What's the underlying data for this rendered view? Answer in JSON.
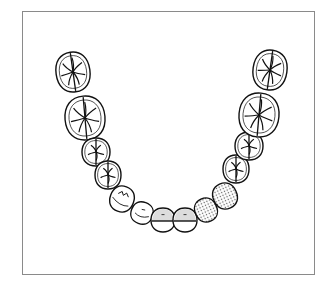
{
  "diagram": {
    "colors": {
      "frame": "#8a8a8a",
      "outline": "#111111",
      "shaded_fill": "#dcdcdc",
      "dotted_fill": "#555555",
      "background": "#ffffff"
    },
    "teeth": [
      {
        "id": "L-M1",
        "type": "molar",
        "side": "left",
        "cx": 73,
        "cy": 72,
        "rx": 17,
        "ry": 20,
        "rot": -8,
        "fill": "none"
      },
      {
        "id": "L-M2",
        "type": "molar",
        "side": "left",
        "cx": 85,
        "cy": 118,
        "rx": 20,
        "ry": 22,
        "rot": -5,
        "fill": "none"
      },
      {
        "id": "L-PM1",
        "type": "premolar",
        "side": "left",
        "cx": 96,
        "cy": 152,
        "rx": 14,
        "ry": 14,
        "rot": 0,
        "fill": "none"
      },
      {
        "id": "L-PM2",
        "type": "premolar",
        "side": "left",
        "cx": 108,
        "cy": 175,
        "rx": 13,
        "ry": 14,
        "rot": 0,
        "fill": "none"
      },
      {
        "id": "L-C",
        "type": "canine",
        "side": "left",
        "cx": 122,
        "cy": 199,
        "rx": 12,
        "ry": 13,
        "rot": 20,
        "fill": "none"
      },
      {
        "id": "L-I2",
        "type": "incisor",
        "side": "left",
        "cx": 142,
        "cy": 213,
        "rx": 11,
        "ry": 11,
        "rot": 20,
        "fill": "none"
      },
      {
        "id": "L-I1",
        "type": "incisor",
        "side": "left",
        "cx": 163,
        "cy": 220,
        "rx": 12,
        "ry": 12,
        "rot": 0,
        "fill": "half-shaded"
      },
      {
        "id": "R-I1",
        "type": "incisor",
        "side": "right",
        "cx": 185,
        "cy": 220,
        "rx": 12,
        "ry": 12,
        "rot": 0,
        "fill": "half-shaded"
      },
      {
        "id": "R-I2",
        "type": "incisor",
        "side": "right",
        "cx": 206,
        "cy": 210,
        "rx": 11,
        "ry": 12,
        "rot": -25,
        "fill": "dotted"
      },
      {
        "id": "R-C",
        "type": "canine",
        "side": "right",
        "cx": 225,
        "cy": 196,
        "rx": 12,
        "ry": 13,
        "rot": -25,
        "fill": "dotted"
      },
      {
        "id": "R-PM2",
        "type": "premolar",
        "side": "right",
        "cx": 236,
        "cy": 169,
        "rx": 13,
        "ry": 14,
        "rot": 0,
        "fill": "none"
      },
      {
        "id": "R-PM1",
        "type": "premolar",
        "side": "right",
        "cx": 249,
        "cy": 146,
        "rx": 14,
        "ry": 14,
        "rot": 0,
        "fill": "none"
      },
      {
        "id": "R-M2",
        "type": "molar",
        "side": "right",
        "cx": 259,
        "cy": 115,
        "rx": 20,
        "ry": 22,
        "rot": 5,
        "fill": "none"
      },
      {
        "id": "R-M1",
        "type": "molar",
        "side": "right",
        "cx": 270,
        "cy": 70,
        "rx": 17,
        "ry": 20,
        "rot": 8,
        "fill": "none"
      }
    ]
  }
}
